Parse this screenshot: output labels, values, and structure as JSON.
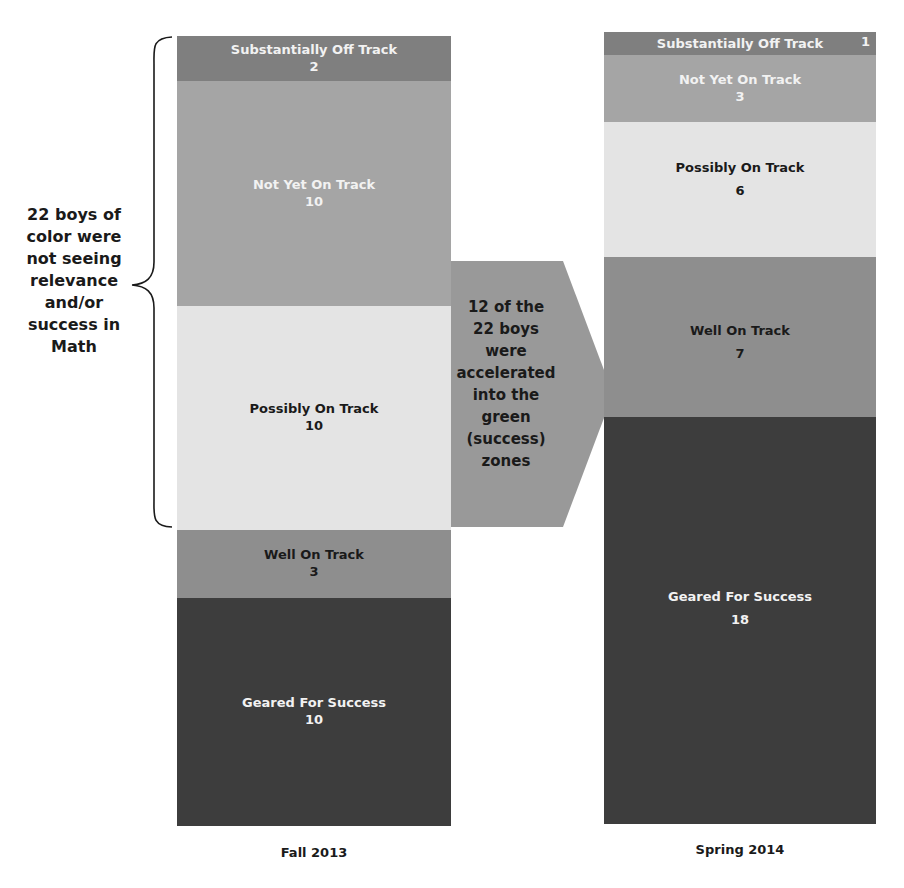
{
  "chart_data": {
    "type": "bar",
    "subtype": "stacked-100-columns",
    "title": "",
    "xlabel": "",
    "ylabel": "",
    "categories": [
      "Fall 2013",
      "Spring 2014"
    ],
    "series": [
      {
        "name": "Substantially Off Track",
        "values": [
          2,
          1
        ],
        "color": "#808080"
      },
      {
        "name": "Not Yet On Track",
        "values": [
          10,
          3
        ],
        "color": "#a6a6a6"
      },
      {
        "name": "Possibly On Track",
        "values": [
          10,
          6
        ],
        "color": "#e6e6e6"
      },
      {
        "name": "Well On Track",
        "values": [
          3,
          7
        ],
        "color": "#8c8c8c"
      },
      {
        "name": "Geared For Success",
        "values": [
          10,
          18
        ],
        "color": "#404040"
      }
    ],
    "totals": [
      35,
      35
    ],
    "annotations": [
      "22 boys of color were not seeing relevance and/or success in Math",
      "12 of the 22 boys were accelerated into the green (success) zones"
    ],
    "grid": false,
    "legend": "none (inline labels)"
  },
  "bars": {
    "fall": {
      "label": "Fall 2013",
      "segments": [
        {
          "name": "Substantially Off Track",
          "value": "2",
          "height": 45,
          "color": "#7f7f7f",
          "text": "light"
        },
        {
          "name": "Not Yet On Track",
          "value": "10",
          "height": 225,
          "color": "#a5a5a5",
          "text": "light"
        },
        {
          "name": "Possibly On Track",
          "value": "10",
          "height": 224,
          "color": "#e4e4e4",
          "text": "dark"
        },
        {
          "name": "Well On Track",
          "value": "3",
          "height": 68,
          "color": "#8e8e8e",
          "text": "dark"
        },
        {
          "name": "Geared For Success",
          "value": "10",
          "height": 228,
          "color": "#3d3d3d",
          "text": "light"
        }
      ]
    },
    "spring": {
      "label": "Spring 2014",
      "segments": [
        {
          "name": "Substantially Off Track",
          "value": "1",
          "height": 23,
          "color": "#7f7f7f",
          "text": "light"
        },
        {
          "name": "Not Yet On Track",
          "value": "3",
          "height": 67,
          "color": "#a5a5a5",
          "text": "light"
        },
        {
          "name": "Possibly On Track",
          "value": "6",
          "height": 135,
          "color": "#e4e4e4",
          "text": "dark"
        },
        {
          "name": "Well On Track",
          "value": "7",
          "height": 160,
          "color": "#8e8e8e",
          "text": "dark"
        },
        {
          "name": "Geared For Success",
          "value": "18",
          "height": 407,
          "color": "#3d3d3d",
          "text": "light"
        }
      ]
    }
  },
  "annotations": {
    "left_brace_text": "22 boys  of color were not seeing relevance and/or success in Math",
    "left_brace_lines": [
      "22 boys  of",
      "color were",
      "not seeing",
      "relevance",
      "and/or",
      "success in",
      "Math"
    ],
    "arrow_lines": [
      "12 of the",
      "22 boys",
      "were",
      "accelerated",
      "into the",
      "green",
      "(success)",
      "zones"
    ],
    "arrow_color": "#999999"
  }
}
